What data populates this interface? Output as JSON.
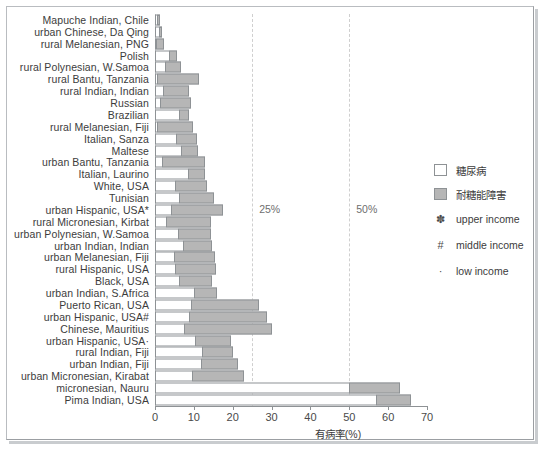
{
  "chart_data": {
    "type": "bar",
    "subtype": "stacked-horizontal",
    "title": "",
    "xlabel": "有病率(%)",
    "ylabel": "",
    "xlim": [
      0,
      70
    ],
    "xticks": [
      0,
      10,
      20,
      30,
      40,
      50,
      60,
      70
    ],
    "xtick_labels": [
      "0",
      "10",
      "20",
      "30",
      "40",
      "50",
      "60",
      "70"
    ],
    "grid": false,
    "legend_position": "right",
    "series": [
      {
        "name": "糖尿病",
        "key": "diabetes",
        "color": "#ffffff"
      },
      {
        "name": "耐糖能障害",
        "key": "igt",
        "color": "#b6b6b6"
      }
    ],
    "annotations": [
      {
        "label": "25%",
        "value": 25,
        "style": "dashed-vline"
      },
      {
        "label": "50%",
        "value": 50,
        "style": "dashed-vline"
      }
    ],
    "categories": [
      "Mapuche Indian, Chile",
      "urban Chinese, Da Qing",
      "rural Melanesian, PNG",
      "Polish",
      "rural Polynesian, W.Samoa",
      "rural Bantu, Tanzania",
      "rural Indian, Indian",
      "Russian",
      "Brazilian",
      "rural Melanesian, Fiji",
      "Italian, Sanza",
      "Maltese",
      "urban Bantu, Tanzania",
      "Italian, Laurino",
      "White, USA",
      "Tunisian",
      "urban Hispanic, USA*",
      "rural Micronesian, Kirbat",
      "urban Polynesian, W.Samoa",
      "urban Indian, Indian",
      "urban Melanesian, Fiji",
      "rural Hispanic, USA",
      "Black, USA",
      "urban Indian, S.Africa",
      "Puerto Rican, USA",
      "urban Hispanic, USA#",
      "Chinese, Mauritius",
      "urban Hispanic, USA·",
      "rural Indian, Fiji",
      "urban Indian, Fiji",
      "urban Micronesian, Kirabat",
      "micronesian, Nauru",
      "Pima Indian, USA"
    ],
    "diabetes": [
      0.4,
      1.0,
      0.3,
      3.5,
      2.5,
      0.6,
      2.0,
      1.3,
      6.2,
      0.5,
      5.4,
      6.8,
      1.8,
      8.4,
      5.2,
      6.2,
      4.0,
      2.8,
      5.8,
      7.2,
      5.0,
      5.2,
      6.2,
      10.0,
      9.2,
      8.8,
      7.4,
      10.4,
      12.2,
      11.8,
      9.6,
      50.0,
      57.0
    ],
    "igt": [
      1.0,
      0.8,
      2.0,
      2.2,
      4.2,
      10.6,
      6.8,
      8.0,
      2.6,
      9.4,
      5.4,
      4.2,
      11.0,
      4.4,
      8.2,
      9.0,
      13.4,
      11.6,
      8.6,
      7.4,
      10.4,
      10.4,
      8.6,
      6.0,
      17.6,
      20.0,
      22.8,
      9.2,
      8.0,
      9.6,
      13.4,
      13.0,
      9.0
    ]
  },
  "legend": {
    "entries": [
      {
        "type": "swatch-white",
        "label": "糖尿病"
      },
      {
        "type": "swatch-gray",
        "label": "耐糖能障害"
      },
      {
        "type": "symbol",
        "mark": "✽",
        "label": "upper income"
      },
      {
        "type": "symbol",
        "mark": "#",
        "label": "middle income"
      },
      {
        "type": "symbol",
        "mark": "·",
        "label": "low income"
      }
    ]
  },
  "colors": {
    "bar_white": "#ffffff",
    "bar_gray": "#b6b6b6",
    "bar_border": "#8e9295",
    "refline": "#cfcfcf",
    "text": "#3c3c3c",
    "frame": "#b9bcc0"
  }
}
